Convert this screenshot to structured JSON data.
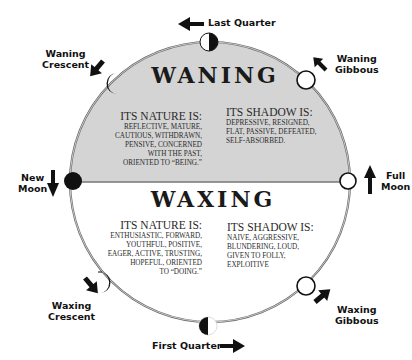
{
  "diagram": {
    "type": "lunar-phase-cycle",
    "colors": {
      "waning_fill": "#d4d4d4",
      "waxing_fill": "#ffffff",
      "outline": "#555555",
      "ink": "#111111"
    },
    "waning": {
      "heading": "WANING",
      "nature": {
        "title": "ITS NATURE IS:",
        "lines": [
          "REFLECTIVE, MATURE,",
          "CAUTIOUS, WITHDRAWN,",
          "PENSIVE,  CONCERNED",
          "WITH THE PAST,",
          "ORIENTED TO “BEING.”"
        ]
      },
      "shadow": {
        "title": "ITS SHADOW IS:",
        "lines": [
          "DEPRESSIVE, RESIGNED,",
          "FLAT, PASSIVE, DEFEATED,",
          "SELF-ABSORBED."
        ]
      }
    },
    "waxing": {
      "heading": "WAXING",
      "nature": {
        "title": "ITS NATURE IS:",
        "lines": [
          "ENTHUSIASTIC, FORWARD,",
          "YOUTHFUL, POSITIVE,",
          "EAGER, ACTIVE, TRUSTING,",
          "HOPEFUL, ORIENTED",
          "TO “DOING.”"
        ]
      },
      "shadow": {
        "title": "ITS SHADOW IS:",
        "lines": [
          "NAIVE, AGGRESSIVE,",
          "BLUNDERING, LOUD,",
          "GIVEN TO FOLLY,",
          "EXPLOITIVE"
        ]
      }
    },
    "phases": [
      {
        "id": "last-quarter",
        "line1": "Last Quarter",
        "line2": ""
      },
      {
        "id": "waning-gibbous",
        "line1": "Waning",
        "line2": "Gibbous"
      },
      {
        "id": "full-moon",
        "line1": "Full",
        "line2": "Moon"
      },
      {
        "id": "waxing-gibbous",
        "line1": "Waxing",
        "line2": "Gibbous"
      },
      {
        "id": "first-quarter",
        "line1": "First Quarter",
        "line2": ""
      },
      {
        "id": "waxing-crescent",
        "line1": "Waxing",
        "line2": "Crescent"
      },
      {
        "id": "new-moon",
        "line1": "New",
        "line2": "Moon"
      },
      {
        "id": "waning-crescent",
        "line1": "Waning",
        "line2": "Crescent"
      }
    ],
    "icons": {
      "arrow": "arrow-icon",
      "moon": "moon-phase-icon"
    }
  }
}
